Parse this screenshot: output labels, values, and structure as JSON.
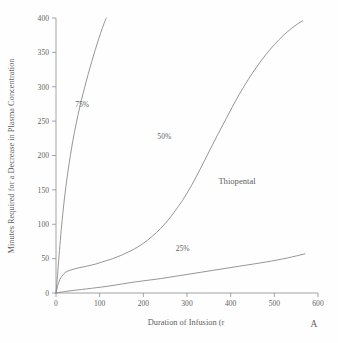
{
  "chart_data": {
    "type": "line",
    "title": "",
    "panel_label": "A",
    "annotation": "Thiopental",
    "xlabel": "Duration of Infusion (r",
    "ylabel": "Minutes Required for a Decrease in Plasma Concentration",
    "xlim": [
      0,
      600
    ],
    "ylim": [
      0,
      400
    ],
    "xticks": [
      0,
      100,
      200,
      300,
      400,
      500,
      600
    ],
    "yticks": [
      0,
      50,
      100,
      150,
      200,
      250,
      300,
      350,
      400
    ],
    "grid": false,
    "legend_position": "inline-curve-labels",
    "line_color": "#8a8a8a",
    "axis_color": "#8d8d8d",
    "text_color": "#5e5e5e",
    "background_color": "#fefefe",
    "series": [
      {
        "name": "75%",
        "label": "75%",
        "label_x": 60,
        "label_y": 275,
        "x": [
          0,
          2,
          5,
          8,
          12,
          16,
          20,
          25,
          30,
          36,
          42,
          50,
          58,
          66,
          74,
          82,
          90,
          98,
          106,
          113,
          116
        ],
        "y": [
          0,
          14,
          38,
          62,
          92,
          118,
          141,
          166,
          188,
          212,
          233,
          258,
          280,
          300,
          319,
          337,
          354,
          370,
          385,
          397,
          400
        ]
      },
      {
        "name": "50%",
        "label": "50%",
        "label_x": 248,
        "label_y": 228,
        "x": [
          0,
          1,
          2,
          4,
          6,
          9,
          13,
          18,
          24,
          32,
          42,
          55,
          70,
          90,
          110,
          130,
          150,
          170,
          190,
          210,
          230,
          250,
          270,
          290,
          310,
          330,
          350,
          370,
          390,
          410,
          430,
          450,
          470,
          490,
          510,
          530,
          550,
          565
        ],
        "y": [
          0,
          3,
          6,
          11,
          15,
          20,
          24,
          28,
          31,
          33,
          35,
          37,
          39,
          42,
          46,
          50,
          55,
          61,
          68,
          77,
          88,
          101,
          117,
          135,
          156,
          180,
          205,
          230,
          254,
          278,
          300,
          320,
          338,
          354,
          368,
          380,
          390,
          396
        ]
      },
      {
        "name": "25%",
        "label": "25%",
        "label_x": 290,
        "label_y": 65,
        "x": [
          0,
          30,
          70,
          120,
          180,
          240,
          300,
          360,
          420,
          480,
          530,
          570
        ],
        "y": [
          0,
          3,
          6,
          10,
          16,
          21,
          27,
          33,
          39,
          45,
          51,
          57
        ]
      }
    ]
  }
}
